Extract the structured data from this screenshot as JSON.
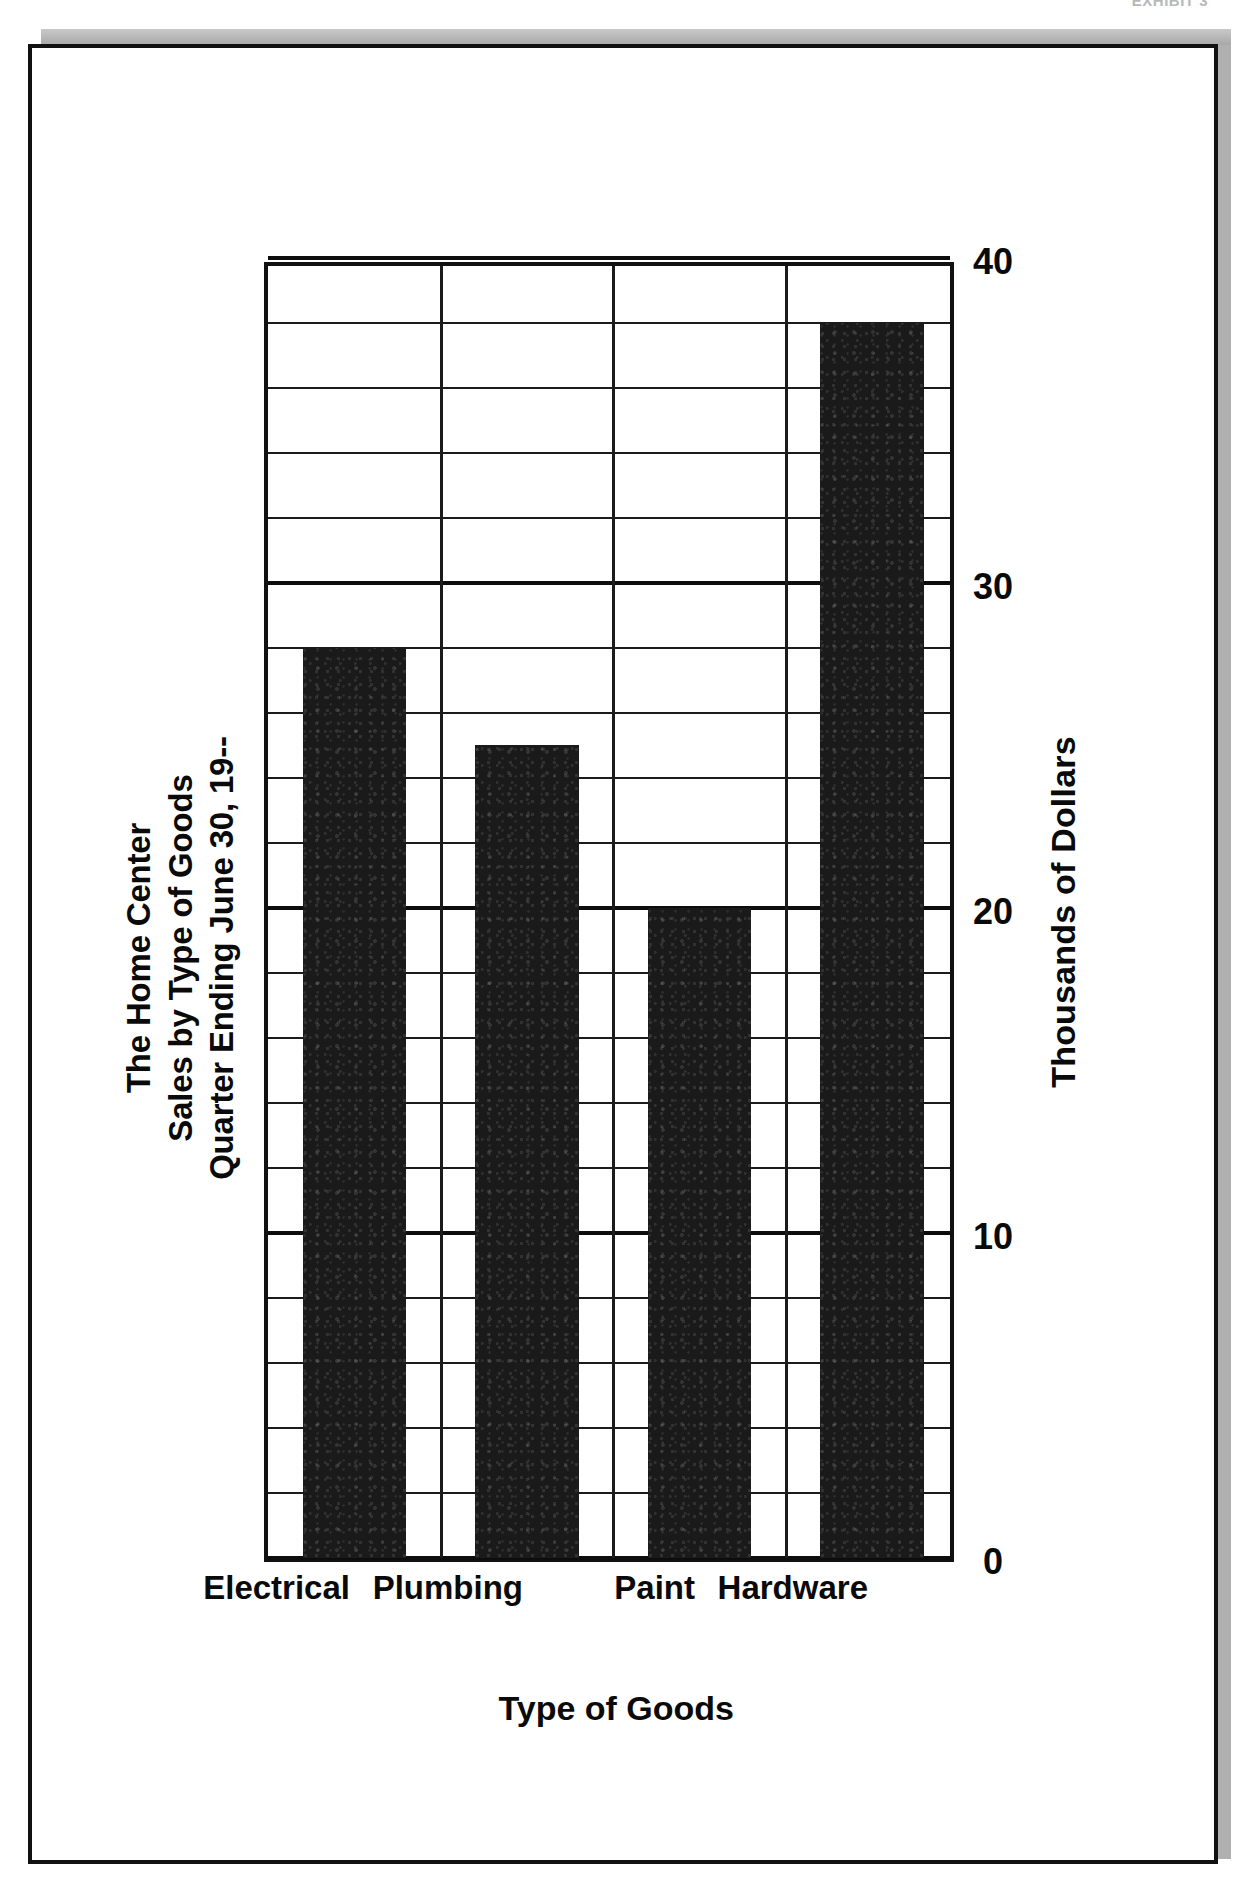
{
  "page": {
    "header_left": "",
    "header_right": "EXHIBIT 3"
  },
  "chart_data": {
    "type": "bar",
    "orientation": "horizontal",
    "title": "The Home Center\nSales by Type of Goods\nQuarter Ending June 30, 19--",
    "title_lines": [
      "The Home Center",
      "Sales by Type of Goods",
      "Quarter Ending June 30, 19--"
    ],
    "categories": [
      "Electrical",
      "Plumbing",
      "Paint",
      "Hardware"
    ],
    "values": [
      28,
      25,
      20,
      38
    ],
    "xlabel": "Thousands of Dollars",
    "ylabel": "Type of Goods",
    "xlim": [
      0,
      40
    ],
    "tick_labels": [
      "0",
      "10",
      "20",
      "30",
      "40"
    ],
    "tick_values": [
      0,
      10,
      20,
      30,
      40
    ],
    "minor_tick_step": 2,
    "grid": true,
    "legend": false,
    "bar_color": "#1a1a1a",
    "plot_border_color": "#111111",
    "background_color": "#ffffff"
  }
}
